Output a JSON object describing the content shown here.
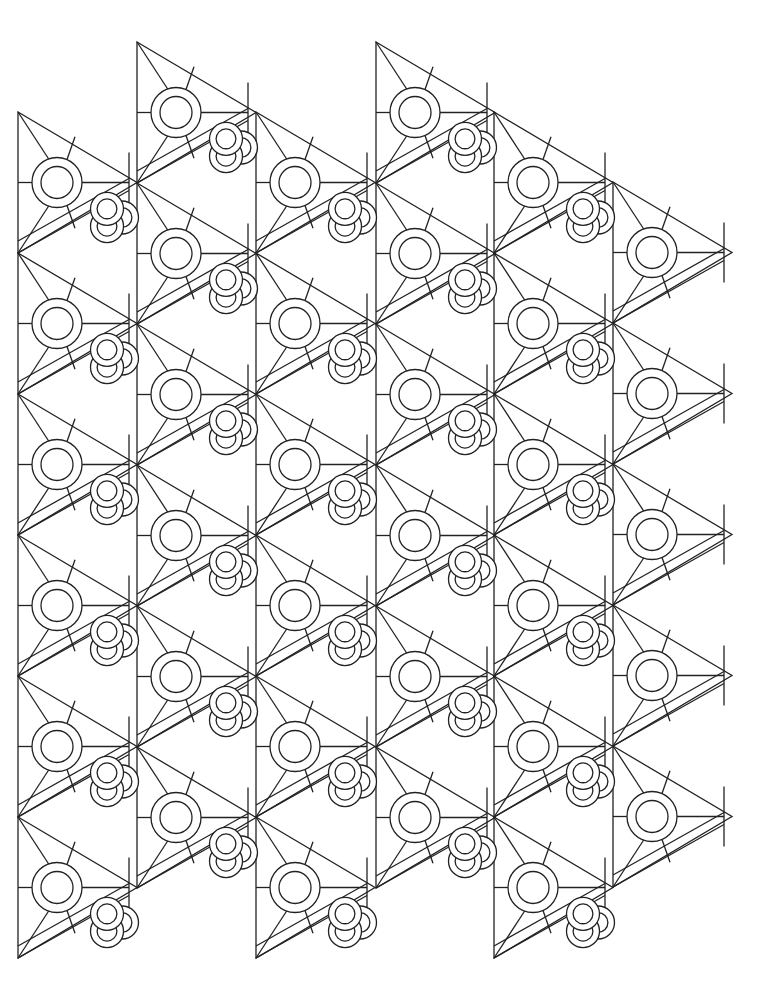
{
  "page": {
    "type": "coloring-page",
    "background_color": "#ffffff",
    "line_color": "#222222"
  },
  "grid": {
    "column_x": [
      18,
      137,
      256,
      376,
      494,
      613
    ],
    "column_width": 119,
    "row_height": 141,
    "columns": [
      {
        "x": 18,
        "first_tip_y": 112,
        "count": 6
      },
      {
        "x": 137,
        "first_tip_y": 42,
        "count": 6
      },
      {
        "x": 256,
        "first_tip_y": 112,
        "count": 6
      },
      {
        "x": 376,
        "first_tip_y": 42,
        "count": 6
      },
      {
        "x": 494,
        "first_tip_y": 112,
        "count": 6
      },
      {
        "x": 613,
        "first_tip_y": 182,
        "count": 5
      }
    ],
    "ring_outer_radius": 25,
    "ring_inner_radius": 16,
    "knot_radius": 22
  }
}
